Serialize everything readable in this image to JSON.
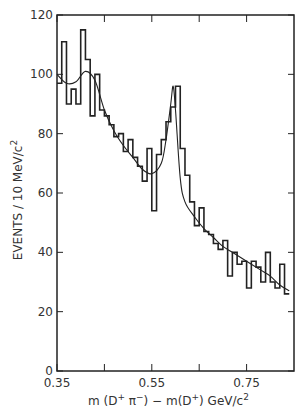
{
  "chart_data": {
    "type": "bar",
    "subtype": "histogram-with-fit",
    "title": "",
    "xlabel": "m(D⁺π⁻) − m(D⁺)  GeV/c²",
    "ylabel": "EVENTS / 10 MeV/c²",
    "xlim": [
      0.35,
      0.85
    ],
    "ylim": [
      0,
      120
    ],
    "x_ticks": [
      0.35,
      0.55,
      0.75
    ],
    "x_tick_labels": [
      "0.35",
      "0.55",
      "0.75"
    ],
    "x_minor_ticks": [
      0.45,
      0.65
    ],
    "y_ticks": [
      0,
      20,
      40,
      60,
      80,
      100,
      120
    ],
    "y_tick_labels": [
      "0",
      "20",
      "40",
      "60",
      "80",
      "100",
      "120"
    ],
    "grid": false,
    "legend": null,
    "bin_width": 0.01,
    "bin_edges_start": 0.35,
    "series": [
      {
        "name": "data histogram",
        "values": [
          97,
          111,
          90,
          95,
          90,
          115,
          105,
          86,
          100,
          88,
          86,
          83,
          79,
          80,
          74,
          78,
          72,
          69,
          64,
          75,
          54,
          73,
          78,
          84,
          89,
          96,
          75,
          66,
          57,
          49,
          55,
          47,
          46,
          43,
          41,
          44,
          32,
          40,
          36,
          37,
          28,
          37,
          35,
          30,
          40,
          30,
          28,
          36,
          26
        ]
      },
      {
        "name": "fit curve",
        "x": [
          0.35,
          0.37,
          0.39,
          0.41,
          0.43,
          0.45,
          0.47,
          0.49,
          0.51,
          0.53,
          0.55,
          0.57,
          0.58,
          0.59,
          0.595,
          0.6,
          0.61,
          0.62,
          0.64,
          0.66,
          0.68,
          0.7,
          0.72,
          0.74,
          0.76,
          0.78,
          0.8,
          0.82,
          0.84
        ],
        "values": [
          100,
          97,
          97.5,
          101,
          98,
          88,
          81,
          76,
          72,
          68,
          66.5,
          70,
          78,
          90,
          96,
          88,
          65,
          57,
          52,
          48,
          45,
          42,
          40,
          38,
          36,
          34,
          32,
          29,
          27
        ]
      }
    ]
  },
  "axes": {
    "x_title_main": "m (D",
    "x_title_sup1": "+",
    "x_title_mid": " π",
    "x_title_sup2": "−",
    "x_title_mid2": ") − m(D",
    "x_title_sup3": "+",
    "x_title_end": ")  GeV/c",
    "x_title_sup4": "2",
    "y_title": "EVENTS / 10 MeV/c",
    "y_title_sup": "2"
  }
}
